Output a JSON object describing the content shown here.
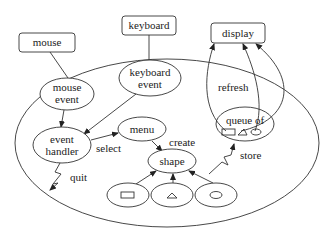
{
  "diagram": {
    "type": "architecture-flow",
    "external_boxes": [
      {
        "id": "mouse",
        "label": "mouse"
      },
      {
        "id": "keyboard",
        "label": "keyboard"
      },
      {
        "id": "display",
        "label": "display"
      }
    ],
    "nodes": [
      {
        "id": "mouse_event",
        "lines": [
          "mouse",
          "event"
        ]
      },
      {
        "id": "keyboard_event",
        "lines": [
          "keyboard",
          "event"
        ]
      },
      {
        "id": "event_handler",
        "lines": [
          "event",
          "handler"
        ]
      },
      {
        "id": "menu",
        "label": "menu"
      },
      {
        "id": "shape",
        "label": "shape"
      },
      {
        "id": "queue",
        "label": "queue of"
      },
      {
        "id": "rect_shape",
        "icon": "rectangle-icon"
      },
      {
        "id": "tri_shape",
        "icon": "triangle-icon"
      },
      {
        "id": "circle_shape",
        "icon": "circle-icon"
      }
    ],
    "edge_labels": {
      "select": "select",
      "create": "create",
      "quit": "quit",
      "store": "store",
      "refresh": "refresh"
    },
    "edges": [
      {
        "from": "mouse",
        "to": "mouse_event"
      },
      {
        "from": "keyboard",
        "to": "keyboard_event"
      },
      {
        "from": "mouse_event",
        "to": "event_handler"
      },
      {
        "from": "keyboard_event",
        "to": "event_handler"
      },
      {
        "from": "event_handler",
        "to": "menu",
        "label": "select"
      },
      {
        "from": "menu",
        "to": "shape",
        "label": "create"
      },
      {
        "from": "rect_shape",
        "to": "shape"
      },
      {
        "from": "tri_shape",
        "to": "shape"
      },
      {
        "from": "circle_shape",
        "to": "shape"
      },
      {
        "from": "event_handler",
        "to": "exit",
        "label": "quit"
      },
      {
        "from": "circle_shape",
        "to": "queue",
        "label": "store"
      },
      {
        "from": "queue",
        "to": "display",
        "label": "refresh"
      }
    ]
  }
}
